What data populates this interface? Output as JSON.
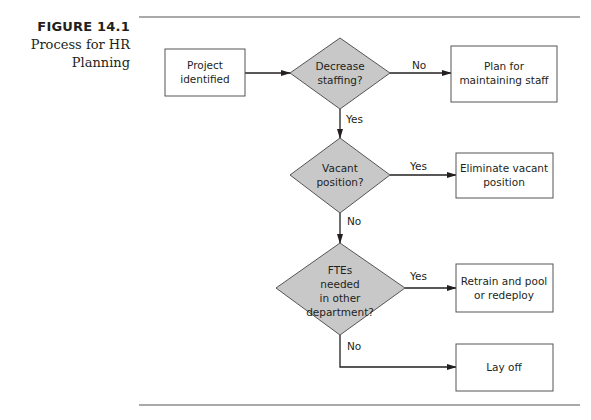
{
  "figure": {
    "number": "FIGURE 14.1",
    "title_line1": "Process for HR",
    "title_line2": "Planning"
  },
  "flowchart": {
    "colors": {
      "diamond_fill": "#c8c8c8",
      "stroke": "#231f20",
      "rule": "#555555"
    },
    "nodes": [
      {
        "id": "project",
        "type": "process",
        "lines": [
          "Project",
          "identified"
        ]
      },
      {
        "id": "decrease",
        "type": "decision",
        "lines": [
          "Decrease",
          "staffing?"
        ]
      },
      {
        "id": "plan",
        "type": "process",
        "lines": [
          "Plan for",
          "maintaining staff"
        ]
      },
      {
        "id": "vacant",
        "type": "decision",
        "lines": [
          "Vacant",
          "position?"
        ]
      },
      {
        "id": "eliminate",
        "type": "process",
        "lines": [
          "Eliminate vacant",
          "position"
        ]
      },
      {
        "id": "ftes",
        "type": "decision",
        "lines": [
          "FTEs",
          "needed",
          "in other",
          "department?"
        ]
      },
      {
        "id": "retrain",
        "type": "process",
        "lines": [
          "Retrain and pool",
          "or redeploy"
        ]
      },
      {
        "id": "layoff",
        "type": "process",
        "lines": [
          "Lay off"
        ]
      }
    ],
    "edges": [
      {
        "from": "project",
        "to": "decrease",
        "label": ""
      },
      {
        "from": "decrease",
        "to": "plan",
        "label": "No"
      },
      {
        "from": "decrease",
        "to": "vacant",
        "label": "Yes"
      },
      {
        "from": "vacant",
        "to": "eliminate",
        "label": "Yes"
      },
      {
        "from": "vacant",
        "to": "ftes",
        "label": "No"
      },
      {
        "from": "ftes",
        "to": "retrain",
        "label": "Yes"
      },
      {
        "from": "ftes",
        "to": "layoff",
        "label": "No"
      }
    ]
  }
}
